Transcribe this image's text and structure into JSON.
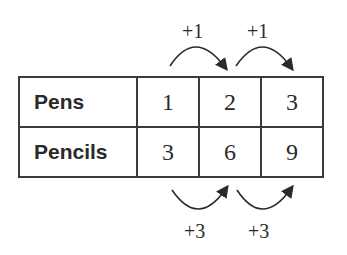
{
  "table": {
    "rows": [
      {
        "label": "Pens",
        "values": [
          "1",
          "2",
          "3"
        ]
      },
      {
        "label": "Pencils",
        "values": [
          "3",
          "6",
          "9"
        ]
      }
    ]
  },
  "annotations": {
    "top": [
      "+1",
      "+1"
    ],
    "bottom": [
      "+3",
      "+3"
    ]
  },
  "colors": {
    "ink": "#2a2a2a",
    "background": "#ffffff"
  }
}
